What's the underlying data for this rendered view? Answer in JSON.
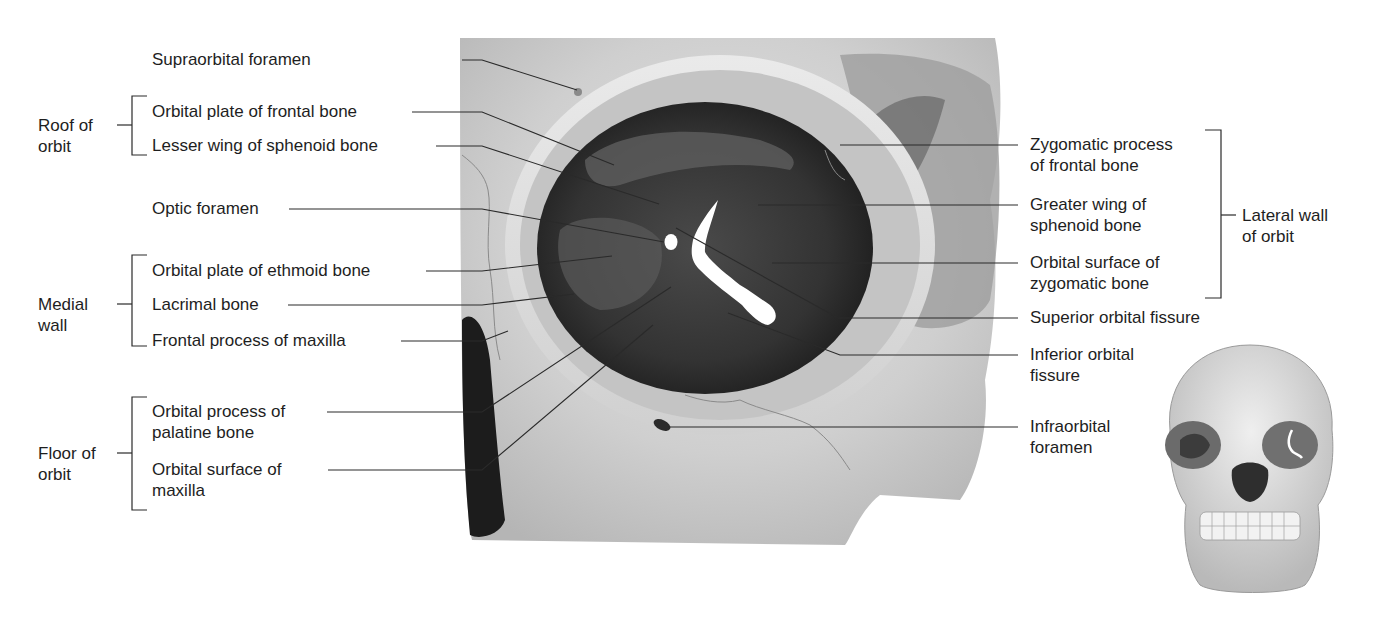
{
  "figure": {
    "groups": {
      "roof": {
        "label_line1": "Roof of",
        "label_line2": "orbit"
      },
      "medial": {
        "label_line1": "Medial",
        "label_line2": "wall"
      },
      "floor": {
        "label_line1": "Floor of",
        "label_line2": "orbit"
      },
      "lateral": {
        "label_line1": "Lateral wall",
        "label_line2": "of orbit"
      }
    },
    "left_labels": {
      "supraorbital_foramen": "Supraorbital foramen",
      "orbital_plate_frontal": "Orbital plate of frontal bone",
      "lesser_wing_sphenoid": "Lesser wing of sphenoid bone",
      "optic_foramen": "Optic foramen",
      "orbital_plate_ethmoid": "Orbital plate of ethmoid bone",
      "lacrimal_bone": "Lacrimal bone",
      "frontal_process_maxilla": "Frontal process of maxilla",
      "orbital_process_palatine_1": "Orbital process of",
      "orbital_process_palatine_2": "palatine bone",
      "orbital_surface_maxilla_1": "Orbital surface of",
      "orbital_surface_maxilla_2": "maxilla"
    },
    "right_labels": {
      "zygomatic_process_frontal_1": "Zygomatic process",
      "zygomatic_process_frontal_2": "of frontal bone",
      "greater_wing_sphenoid_1": "Greater wing of",
      "greater_wing_sphenoid_2": "sphenoid bone",
      "orbital_surface_zygomatic_1": "Orbital surface of",
      "orbital_surface_zygomatic_2": "zygomatic bone",
      "superior_orbital_fissure": "Superior orbital fissure",
      "inferior_orbital_fissure_1": "Inferior orbital",
      "inferior_orbital_fissure_2": "fissure",
      "infraorbital_foramen_1": "Infraorbital",
      "infraorbital_foramen_2": "foramen"
    },
    "inset": "Anterior view of skull (orientation thumbnail)"
  }
}
